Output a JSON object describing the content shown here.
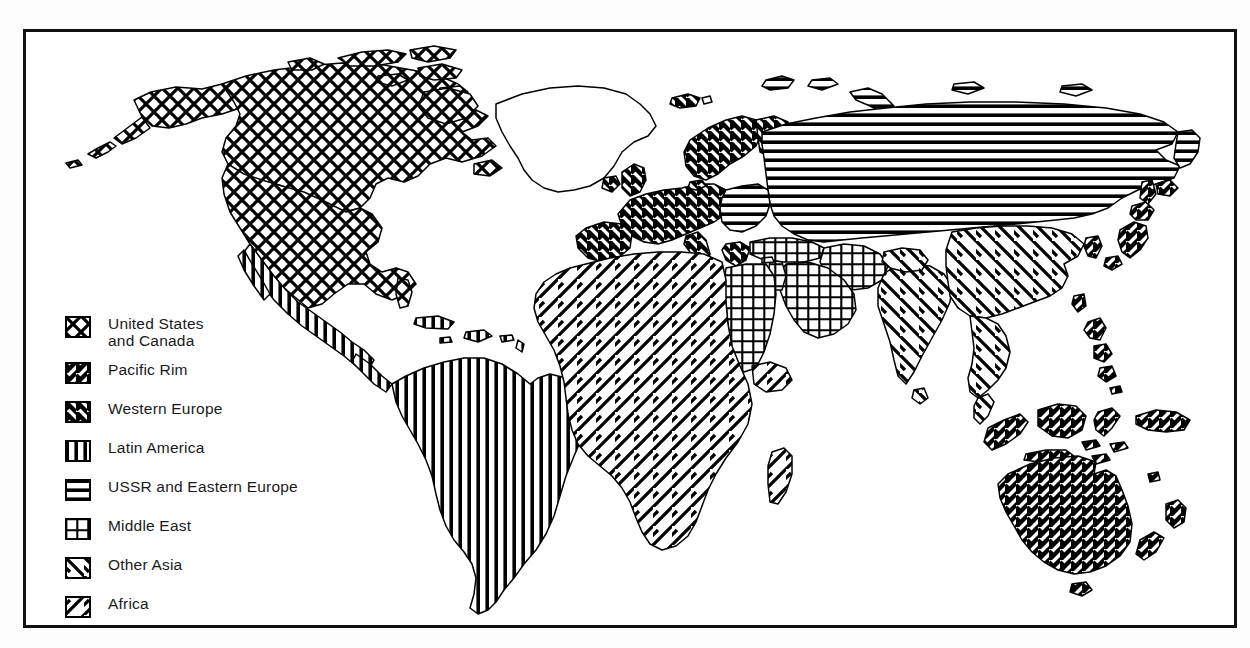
{
  "figure": {
    "kind": "world-map-thematic",
    "background": "#ffffff",
    "frame_color": "#111111"
  },
  "legend": {
    "name": "map-legend",
    "items": [
      {
        "key": "us-canada",
        "label": "United States\n and Canada",
        "pattern": "crosshatch-diagonal",
        "swatch_name": "swatch-us-canada"
      },
      {
        "key": "pacific-rim",
        "label": "Pacific Rim",
        "pattern": "diagonal-forward-bold",
        "swatch_name": "swatch-pacific-rim"
      },
      {
        "key": "western-europe",
        "label": "Western Europe",
        "pattern": "diagonal-back-bold",
        "swatch_name": "swatch-western-europe"
      },
      {
        "key": "latin-america",
        "label": "Latin America",
        "pattern": "vertical",
        "swatch_name": "swatch-latin-america"
      },
      {
        "key": "ussr-eeurope",
        "label": "USSR and  Eastern Europe",
        "pattern": "horizontal",
        "swatch_name": "swatch-ussr-eastern-europe"
      },
      {
        "key": "middle-east",
        "label": "Middle East",
        "pattern": "grid",
        "swatch_name": "swatch-middle-east"
      },
      {
        "key": "other-asia",
        "label": "Other Asia",
        "pattern": "diagonal-back-wide",
        "swatch_name": "swatch-other-asia"
      },
      {
        "key": "africa",
        "label": "Africa",
        "pattern": "diagonal-forward-wide",
        "swatch_name": "swatch-africa"
      }
    ]
  },
  "map_regions": {
    "us-canada": {
      "name": "United States and Canada",
      "areas": [
        "USA",
        "Canada",
        "Alaska",
        "Arctic islands"
      ]
    },
    "latin-america": {
      "name": "Latin America",
      "areas": [
        "Mexico",
        "Central America",
        "Caribbean",
        "South America"
      ]
    },
    "western-europe": {
      "name": "Western Europe",
      "areas": [
        "UK",
        "Ireland",
        "Iberia",
        "France",
        "Germany",
        "Italy",
        "Scandinavia",
        "Greece",
        "Iceland"
      ]
    },
    "ussr-eeurope": {
      "name": "USSR and Eastern Europe",
      "areas": [
        "Soviet Union",
        "Poland",
        "Czechoslovakia",
        "Hungary",
        "Romania",
        "Bulgaria",
        "Yugoslavia"
      ]
    },
    "middle-east": {
      "name": "Middle East",
      "areas": [
        "Turkey",
        "Iran",
        "Iraq",
        "Arabian Peninsula",
        "Egypt",
        "Libya-east",
        "Sudan-north"
      ]
    },
    "africa": {
      "name": "Africa",
      "areas": [
        "Sub-Saharan Africa",
        "North-west Africa",
        "Madagascar"
      ]
    },
    "other-asia": {
      "name": "Other Asia",
      "areas": [
        "India",
        "Pakistan",
        "China",
        "Mongolia",
        "Afghanistan",
        "Southeast Asia mainland"
      ]
    },
    "pacific-rim": {
      "name": "Pacific Rim",
      "areas": [
        "Japan",
        "Korea",
        "Taiwan",
        "Philippines",
        "Indonesia",
        "Malaysia",
        "Australia",
        "New Zealand",
        "Papua New Guinea"
      ]
    },
    "unclassified": {
      "name": "Unclassified",
      "areas": [
        "Greenland",
        "Antarctica"
      ]
    }
  }
}
